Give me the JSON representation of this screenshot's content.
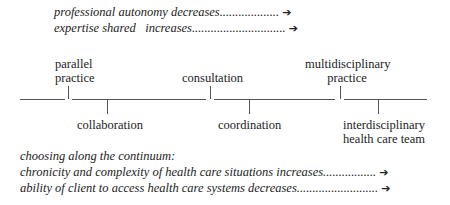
{
  "top_notes": [
    {
      "text": "professional autonomy decreases",
      "dots": "...................",
      "arrow": "➔"
    },
    {
      "text": "expertise shared   increases",
      "dots": "..............................",
      "arrow": "➔"
    }
  ],
  "continuum": {
    "above": [
      {
        "line1": "parallel",
        "line2": "practice"
      },
      {
        "line1": "consultation",
        "line2": ""
      },
      {
        "line1": "multidisciplinary",
        "line2": "practice"
      }
    ],
    "below": [
      {
        "line1": "collaboration",
        "line2": ""
      },
      {
        "line1": "coordination",
        "line2": ""
      },
      {
        "line1": "interdisciplinary",
        "line2": "health care team"
      }
    ]
  },
  "bottom_notes": {
    "heading": "choosing along the continuum:",
    "items": [
      {
        "text": "chronicity and complexity of health care situations increases",
        "dots": ".................",
        "arrow": "➔"
      },
      {
        "text": "ability of client to access health care systems decreases",
        "dots": "..........................",
        "arrow": "➔"
      }
    ]
  }
}
